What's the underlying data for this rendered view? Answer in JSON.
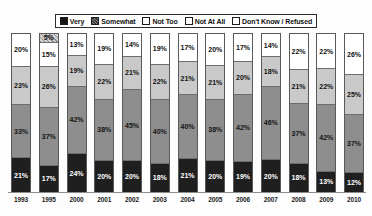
{
  "legend": {
    "position": "top-center",
    "items": [
      {
        "label": "Very",
        "key": "very",
        "swatch": "solid-black-square-icon",
        "color": "#1f1f1f"
      },
      {
        "label": "Somewhat",
        "key": "somewhat",
        "swatch": "hatched-gray-square-icon",
        "color": "#8e8e8e"
      },
      {
        "label": "Not Too",
        "key": "not_too",
        "swatch": "light-gray-square-icon",
        "color": "#c9c9c9"
      },
      {
        "label": "Not At All",
        "key": "not_at_all",
        "swatch": "white-square-icon",
        "color": "#ffffff"
      },
      {
        "label": "Don't Know / Refused",
        "key": "dont_know",
        "swatch": "patterned-square-icon",
        "color": "#d2d2d2"
      }
    ]
  },
  "chart_data": {
    "type": "bar",
    "title": "",
    "subtitle": "",
    "xlabel": "",
    "ylabel": "",
    "ylim": [
      0,
      100
    ],
    "grid": false,
    "stacked": true,
    "stack_order_bottom_to_top": [
      "Very",
      "Somewhat",
      "Not Too",
      "Not At All",
      "Don't Know / Refused"
    ],
    "value_suffix": "%",
    "legend_position": "top-center",
    "categories": [
      "1993",
      "1995",
      "2000",
      "2001",
      "2002",
      "2003",
      "2004",
      "2005",
      "2006",
      "2007",
      "2008",
      "2009",
      "2010"
    ],
    "series": [
      {
        "name": "Very",
        "values": [
          21,
          17,
          24,
          20,
          20,
          18,
          21,
          20,
          19,
          20,
          18,
          13,
          12
        ]
      },
      {
        "name": "Somewhat",
        "values": [
          33,
          37,
          42,
          38,
          45,
          40,
          40,
          38,
          42,
          46,
          37,
          42,
          37
        ]
      },
      {
        "name": "Not Too",
        "values": [
          23,
          26,
          19,
          22,
          21,
          22,
          21,
          21,
          20,
          18,
          21,
          22,
          25
        ]
      },
      {
        "name": "Not At All",
        "values": [
          20,
          15,
          13,
          19,
          14,
          19,
          17,
          20,
          17,
          14,
          22,
          22,
          26
        ]
      },
      {
        "name": "Don't Know / Refused",
        "values": [
          0,
          5,
          0,
          0,
          0,
          0,
          0,
          0,
          0,
          0,
          0,
          0,
          0
        ]
      }
    ],
    "columns": [
      {
        "year": "1993",
        "segments": [
          {
            "key": "dont_know",
            "label": "",
            "value": 0
          },
          {
            "key": "notatall",
            "label": "20%",
            "value": 20
          },
          {
            "key": "nottoo",
            "label": "23%",
            "value": 23
          },
          {
            "key": "somewhat",
            "label": "33%",
            "value": 33
          },
          {
            "key": "very",
            "label": "21%",
            "value": 21
          }
        ]
      },
      {
        "year": "1995",
        "segments": [
          {
            "key": "dont_know",
            "label": "5%",
            "value": 5
          },
          {
            "key": "notatall",
            "label": "15%",
            "value": 15
          },
          {
            "key": "nottoo",
            "label": "26%",
            "value": 26
          },
          {
            "key": "somewhat",
            "label": "37%",
            "value": 37
          },
          {
            "key": "very",
            "label": "17%",
            "value": 17
          }
        ]
      },
      {
        "year": "2000",
        "segments": [
          {
            "key": "dont_know",
            "label": "",
            "value": 0
          },
          {
            "key": "notatall",
            "label": "13%",
            "value": 13
          },
          {
            "key": "nottoo",
            "label": "19%",
            "value": 19
          },
          {
            "key": "somewhat",
            "label": "42%",
            "value": 42
          },
          {
            "key": "very",
            "label": "24%",
            "value": 24
          }
        ]
      },
      {
        "year": "2001",
        "segments": [
          {
            "key": "dont_know",
            "label": "",
            "value": 0
          },
          {
            "key": "notatall",
            "label": "19%",
            "value": 19
          },
          {
            "key": "nottoo",
            "label": "22%",
            "value": 22
          },
          {
            "key": "somewhat",
            "label": "38%",
            "value": 38
          },
          {
            "key": "very",
            "label": "20%",
            "value": 20
          }
        ]
      },
      {
        "year": "2002",
        "segments": [
          {
            "key": "dont_know",
            "label": "",
            "value": 0
          },
          {
            "key": "notatall",
            "label": "14%",
            "value": 14
          },
          {
            "key": "nottoo",
            "label": "21%",
            "value": 21
          },
          {
            "key": "somewhat",
            "label": "45%",
            "value": 45
          },
          {
            "key": "very",
            "label": "20%",
            "value": 20
          }
        ]
      },
      {
        "year": "2003",
        "segments": [
          {
            "key": "dont_know",
            "label": "",
            "value": 0
          },
          {
            "key": "notatall",
            "label": "19%",
            "value": 19
          },
          {
            "key": "nottoo",
            "label": "22%",
            "value": 22
          },
          {
            "key": "somewhat",
            "label": "40%",
            "value": 40
          },
          {
            "key": "very",
            "label": "18%",
            "value": 18
          }
        ]
      },
      {
        "year": "2004",
        "segments": [
          {
            "key": "dont_know",
            "label": "",
            "value": 0
          },
          {
            "key": "notatall",
            "label": "17%",
            "value": 17
          },
          {
            "key": "nottoo",
            "label": "21%",
            "value": 21
          },
          {
            "key": "somewhat",
            "label": "40%",
            "value": 40
          },
          {
            "key": "very",
            "label": "21%",
            "value": 21
          }
        ]
      },
      {
        "year": "2005",
        "segments": [
          {
            "key": "dont_know",
            "label": "",
            "value": 0
          },
          {
            "key": "notatall",
            "label": "20%",
            "value": 20
          },
          {
            "key": "nottoo",
            "label": "21%",
            "value": 21
          },
          {
            "key": "somewhat",
            "label": "38%",
            "value": 38
          },
          {
            "key": "very",
            "label": "20%",
            "value": 20
          }
        ]
      },
      {
        "year": "2006",
        "segments": [
          {
            "key": "dont_know",
            "label": "",
            "value": 0
          },
          {
            "key": "notatall",
            "label": "17%",
            "value": 17
          },
          {
            "key": "nottoo",
            "label": "20%",
            "value": 20
          },
          {
            "key": "somewhat",
            "label": "42%",
            "value": 42
          },
          {
            "key": "very",
            "label": "19%",
            "value": 19
          }
        ]
      },
      {
        "year": "2007",
        "segments": [
          {
            "key": "dont_know",
            "label": "",
            "value": 0
          },
          {
            "key": "notatall",
            "label": "14%",
            "value": 14
          },
          {
            "key": "nottoo",
            "label": "18%",
            "value": 18
          },
          {
            "key": "somewhat",
            "label": "46%",
            "value": 46
          },
          {
            "key": "very",
            "label": "20%",
            "value": 20
          }
        ]
      },
      {
        "year": "2008",
        "segments": [
          {
            "key": "dont_know",
            "label": "",
            "value": 0
          },
          {
            "key": "notatall",
            "label": "22%",
            "value": 22
          },
          {
            "key": "nottoo",
            "label": "21%",
            "value": 21
          },
          {
            "key": "somewhat",
            "label": "37%",
            "value": 37
          },
          {
            "key": "very",
            "label": "18%",
            "value": 18
          }
        ]
      },
      {
        "year": "2009",
        "segments": [
          {
            "key": "dont_know",
            "label": "",
            "value": 0
          },
          {
            "key": "notatall",
            "label": "22%",
            "value": 22
          },
          {
            "key": "nottoo",
            "label": "22%",
            "value": 22
          },
          {
            "key": "somewhat",
            "label": "42%",
            "value": 42
          },
          {
            "key": "very",
            "label": "13%",
            "value": 13
          }
        ]
      },
      {
        "year": "2010",
        "segments": [
          {
            "key": "dont_know",
            "label": "",
            "value": 0
          },
          {
            "key": "notatall",
            "label": "26%",
            "value": 26
          },
          {
            "key": "nottoo",
            "label": "25%",
            "value": 25
          },
          {
            "key": "somewhat",
            "label": "37%",
            "value": 37
          },
          {
            "key": "very",
            "label": "12%",
            "value": 12
          }
        ]
      }
    ]
  }
}
